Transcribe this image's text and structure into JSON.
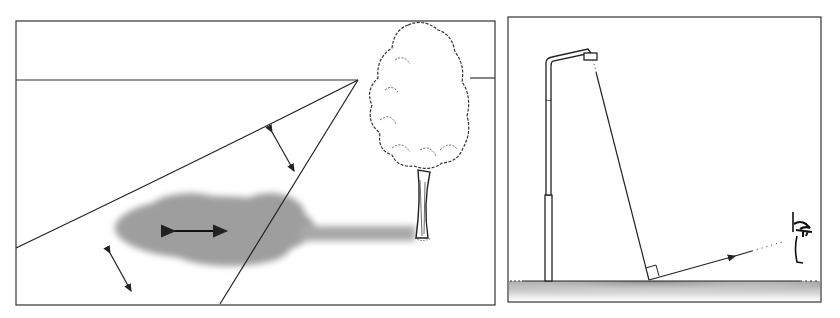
{
  "figure": {
    "panels": [
      {
        "id": "left",
        "description": "Perspective view: light falling on ground from a viewpoint near a tree; shaded area with arrows showing directions of reflection",
        "elements": [
          "frame",
          "horizon-line",
          "sight-lines",
          "tree",
          "ground-shadow",
          "double-arrows"
        ]
      },
      {
        "id": "right",
        "description": "Side view: street lamp, light ray hitting ground at right angle marker, reflected ray to observer eye",
        "elements": [
          "frame",
          "street-lamp",
          "incident-ray",
          "right-angle-marker",
          "reflected-ray",
          "observer-eye",
          "ground"
        ]
      }
    ],
    "colors": {
      "line": "#222222",
      "shadow": "#9a9a9a",
      "ground_gradient_start": "#a8a8a8",
      "background": "#ffffff"
    }
  }
}
